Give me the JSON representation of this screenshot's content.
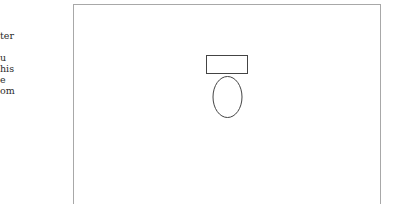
{
  "side_text": {
    "lines": [
      "ter",
      "u",
      "his",
      "e",
      "om"
    ]
  },
  "diagram": {
    "title": "",
    "fixtures": [
      {
        "type": "toilet",
        "parts": [
          "tank",
          "bowl"
        ]
      }
    ],
    "stroke_color": "#444444",
    "frame_color": "#a8a8a8"
  }
}
